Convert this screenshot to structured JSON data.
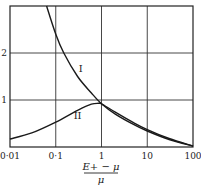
{
  "chart_data": {
    "type": "line",
    "title": "",
    "xlabel": "(E+ − μ)/μ",
    "xlabel_numerator": "E+ − μ",
    "xlabel_denominator": "μ",
    "ylabel": "",
    "xscale": "log",
    "xlim": [
      0.01,
      100
    ],
    "ylim": [
      0,
      3
    ],
    "grid": true,
    "x_ticks": [
      "0·01",
      "0·1",
      "1",
      "10",
      "100"
    ],
    "y_ticks": [
      "1",
      "2"
    ],
    "legend": null,
    "series": [
      {
        "name": "I",
        "label_position": {
          "x": 0.35,
          "y": 1.6
        },
        "x": [
          0.063,
          0.1,
          0.15,
          0.3,
          0.6,
          1,
          2,
          5,
          10,
          30,
          100
        ],
        "y": [
          3.0,
          2.4,
          2.0,
          1.5,
          1.15,
          0.92,
          0.7,
          0.48,
          0.34,
          0.16,
          0.02
        ]
      },
      {
        "name": "II",
        "label_position": {
          "x": 0.3,
          "y": 0.6
        },
        "x": [
          0.01,
          0.03,
          0.1,
          0.3,
          0.6,
          0.85,
          1,
          2,
          5,
          10,
          30,
          100
        ],
        "y": [
          0.17,
          0.3,
          0.53,
          0.78,
          0.91,
          0.93,
          0.92,
          0.74,
          0.52,
          0.37,
          0.18,
          0.02
        ]
      }
    ]
  }
}
